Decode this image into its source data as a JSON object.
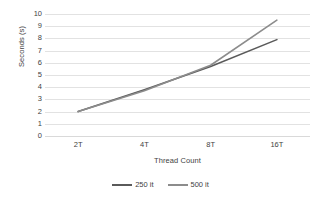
{
  "chart_data": {
    "type": "line",
    "title": "",
    "subtitle": "",
    "xlabel": "Thread Count",
    "ylabel": "Seconds (s)",
    "categories": [
      "2T",
      "4T",
      "8T",
      "16T"
    ],
    "series": [
      {
        "name": "250 it",
        "values": [
          2.0,
          3.8,
          5.7,
          7.9
        ],
        "color": "#5a5a5a"
      },
      {
        "name": "500 it",
        "values": [
          2.0,
          3.7,
          5.8,
          9.5
        ],
        "color": "#8c8c8c"
      }
    ],
    "ylim": [
      0,
      10
    ],
    "yticks": [
      0,
      1,
      2,
      3,
      4,
      5,
      6,
      7,
      8,
      9,
      10
    ],
    "ytick_labels": [
      "0",
      "1",
      "2",
      "3",
      "4",
      "5",
      "6",
      "7",
      "8",
      "9",
      "10"
    ],
    "grid": true,
    "grid_axis": "y",
    "grid_color": "#e2e2e2",
    "legend_position": "bottom",
    "plot_background": "#ffffff",
    "axis_text_color": "#3f3f3f"
  }
}
